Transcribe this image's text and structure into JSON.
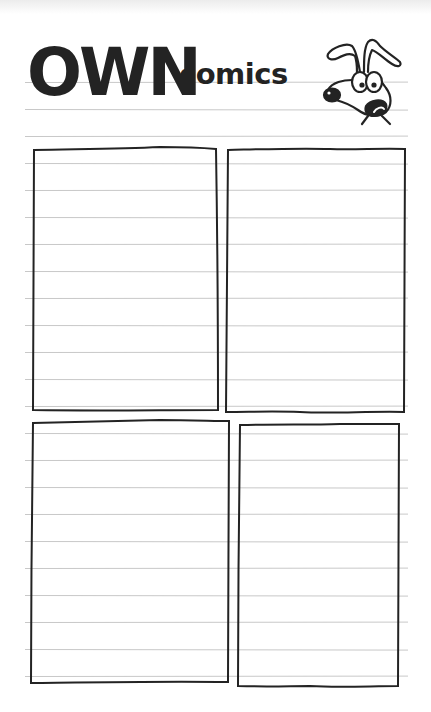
{
  "title": {
    "main": "OWN",
    "sub": "comics"
  },
  "mascot": {
    "icon": "cartoon-dog-icon",
    "description": "cartoon dog head with floppy ears, big eyes, black nose, open mouth"
  },
  "colors": {
    "ink": "#232323",
    "rule_line": "#c8c8c8",
    "paper": "#ffffff"
  },
  "ruled_lines": {
    "start_y": 82,
    "pitch": 27,
    "count": 23,
    "x_start": 25,
    "x_end": 408
  },
  "panels": [
    {
      "id": "panel-1",
      "x": 33,
      "y": 148,
      "width": 184,
      "height": 262
    },
    {
      "id": "panel-2",
      "x": 227,
      "y": 149,
      "width": 178,
      "height": 263
    },
    {
      "id": "panel-3",
      "x": 32,
      "y": 421,
      "width": 196,
      "height": 261
    },
    {
      "id": "panel-4",
      "x": 239,
      "y": 424,
      "width": 160,
      "height": 263
    }
  ]
}
